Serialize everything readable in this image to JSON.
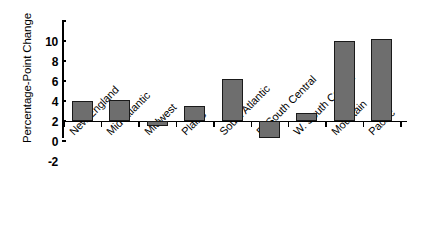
{
  "chart_data": {
    "type": "bar",
    "title": "",
    "subtitle": "",
    "xlabel": "",
    "ylabel": "Percentage-Point Change",
    "categories": [
      "New England",
      "Mid-Atlantic",
      "Midwest",
      "Plains",
      "South Atlantic",
      "E. South Central",
      "W. South Central",
      "Mountain",
      "Pacific"
    ],
    "values": [
      2.0,
      2.1,
      -0.5,
      1.55,
      4.25,
      -1.7,
      0.8,
      8.0,
      8.2
    ],
    "ylim": [
      -2,
      10
    ],
    "ytick_values": [
      10,
      8,
      6,
      4,
      2,
      0,
      -2
    ],
    "ytick_labels": [
      "10",
      "8",
      "6",
      "4",
      "2",
      "0",
      "-2"
    ],
    "ystep": 2,
    "grid": false,
    "legend": false,
    "legend_position": "none",
    "bar_color": "#6e6e6e",
    "bar_edge_color": "#1a1a1a",
    "axis_color": "#000000",
    "background_color": "#ffffff",
    "xlabel_rotation": -45
  }
}
